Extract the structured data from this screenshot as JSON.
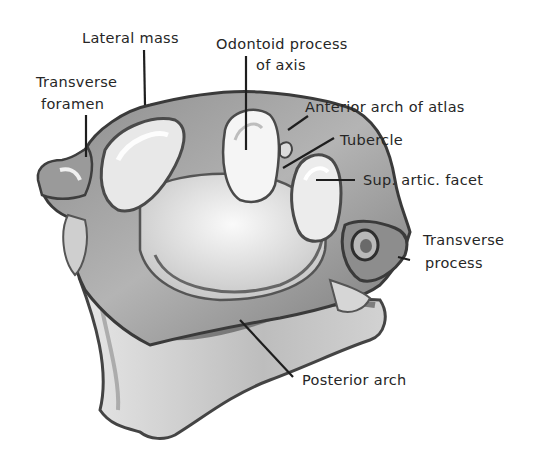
{
  "figure": {
    "colors": {
      "background": "#ffffff",
      "outline": "#3a3a3a",
      "shade_dark": "#6e6e6e",
      "shade_mid": "#a9a9a9",
      "shade_light": "#d9d9d9",
      "highlight": "#f4f4f4",
      "label_text": "#262626",
      "leader_line": "#1e1e1e"
    }
  },
  "labels": {
    "lateral_mass": "Lateral mass",
    "odontoid_line1": "Odontoid process",
    "odontoid_line2": "of axis",
    "transverse_foramen_line1": "Transverse",
    "transverse_foramen_line2": "foramen",
    "anterior_arch": "Anterior arch of atlas",
    "tubercle": "Tubercle",
    "sup_artic_facet": "Sup. artic. facet",
    "transverse_process_line1": "Transverse",
    "transverse_process_line2": "process",
    "posterior_arch": "Posterior arch"
  }
}
